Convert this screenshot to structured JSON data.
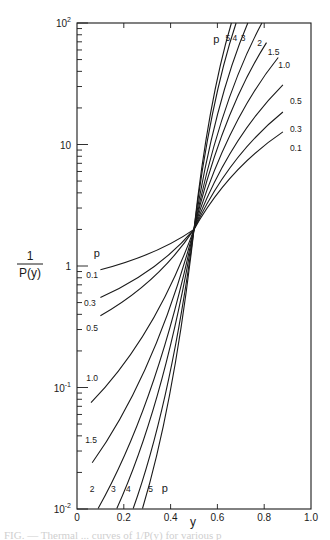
{
  "chart_data": {
    "type": "line",
    "title": "",
    "xlabel": "y",
    "ylabel_numerator": "1",
    "ylabel_denominator": "P(y)",
    "ylabel": "1/P(y)",
    "xlim": [
      0,
      1.0
    ],
    "ylim": [
      0.01,
      100
    ],
    "yscale": "log",
    "grid": false,
    "x_ticks": [
      0,
      0.2,
      0.4,
      0.6,
      0.8,
      1.0
    ],
    "x_tick_labels": [
      "0",
      "0.2",
      "0.4",
      "0.6",
      "0.8",
      "1.0"
    ],
    "y_ticks": [
      0.01,
      0.1,
      1,
      10,
      100
    ],
    "y_tick_labels": [
      {
        "base": "10",
        "exp": "-2"
      },
      {
        "base": "10",
        "exp": "-1"
      },
      {
        "base": "1",
        "exp": ""
      },
      {
        "base": "10",
        "exp": ""
      },
      {
        "base": "10",
        "exp": "2"
      }
    ],
    "crossing_point": {
      "x": 0.5,
      "y": 2.0
    },
    "legend_title": "p",
    "series": [
      {
        "name": "0.1",
        "x": [
          0.1,
          0.5,
          0.88
        ],
        "y": [
          0.93,
          2.0,
          12.7
        ]
      },
      {
        "name": "0.3",
        "x": [
          0.1,
          0.5,
          0.88
        ],
        "y": [
          0.55,
          2.0,
          18.5
        ]
      },
      {
        "name": "0.5",
        "x": [
          0.1,
          0.5,
          0.88
        ],
        "y": [
          0.39,
          2.0,
          31
        ]
      },
      {
        "name": "1.0",
        "x": [
          0.06,
          0.5,
          0.86
        ],
        "y": [
          0.075,
          2.0,
          52
        ]
      },
      {
        "name": "1.5",
        "x": [
          0.065,
          0.5,
          0.81
        ],
        "y": [
          0.024,
          2.0,
          69
        ]
      },
      {
        "name": "2",
        "x": [
          0.09,
          0.5,
          0.79
        ],
        "y": [
          0.0101,
          2.0,
          100
        ]
      },
      {
        "name": "3",
        "x": [
          0.17,
          0.5,
          0.73
        ],
        "y": [
          0.0101,
          2.0,
          100
        ]
      },
      {
        "name": "4",
        "x": [
          0.24,
          0.5,
          0.68
        ],
        "y": [
          0.0101,
          2.0,
          100
        ]
      },
      {
        "name": "5",
        "x": [
          0.28,
          0.5,
          0.66
        ],
        "y": [
          0.0101,
          2.0,
          100
        ]
      }
    ],
    "annotations": {
      "upper_labels": [
        {
          "text": "p",
          "x": 0.595,
          "y": 73
        },
        {
          "text": "5",
          "x": 0.645,
          "y": 75
        },
        {
          "text": "4",
          "x": 0.675,
          "y": 75
        },
        {
          "text": "3",
          "x": 0.71,
          "y": 75
        },
        {
          "text": "2",
          "x": 0.78,
          "y": 68
        },
        {
          "text": "1.5",
          "x": 0.84,
          "y": 58
        },
        {
          "text": "1.0",
          "x": 0.885,
          "y": 45
        },
        {
          "text": "0.5",
          "x": 0.935,
          "y": 23
        },
        {
          "text": "0.3",
          "x": 0.935,
          "y": 13.5
        },
        {
          "text": "0.1",
          "x": 0.935,
          "y": 9.3
        }
      ],
      "lower_labels": [
        {
          "text": "p",
          "x": 0.085,
          "y": 1.25
        },
        {
          "text": "0.1",
          "x": 0.065,
          "y": 0.85
        },
        {
          "text": "0.3",
          "x": 0.055,
          "y": 0.5
        },
        {
          "text": "0.5",
          "x": 0.065,
          "y": 0.31
        },
        {
          "text": "1.0",
          "x": 0.065,
          "y": 0.12
        },
        {
          "text": "1.5",
          "x": 0.06,
          "y": 0.037
        },
        {
          "text": "2",
          "x": 0.065,
          "y": 0.0145
        },
        {
          "text": "3",
          "x": 0.155,
          "y": 0.0145
        },
        {
          "text": "4",
          "x": 0.22,
          "y": 0.0145
        },
        {
          "text": "5",
          "x": 0.315,
          "y": 0.0145
        },
        {
          "text": "p",
          "x": 0.375,
          "y": 0.0145
        }
      ]
    }
  },
  "caption": "FIG. — Thermal ... curves of 1/P(y) for various p"
}
